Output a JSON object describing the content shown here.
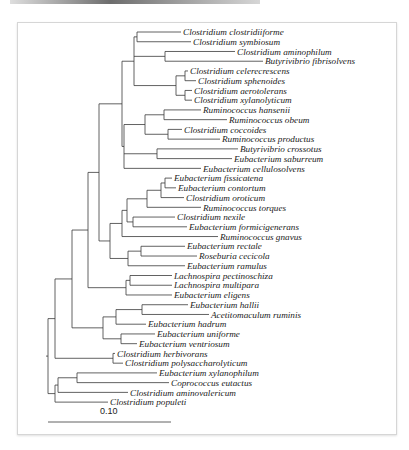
{
  "figure": {
    "type": "phylogenetic-tree",
    "scale_bar": {
      "label": "0.10",
      "x1": 48,
      "x2": 171,
      "y": 422,
      "label_x": 100,
      "label_y": 414
    },
    "leaf_layout": {
      "y_start": 32,
      "y_step": 9.74
    },
    "leaves": [
      {
        "name": "Clostridium clostridiiforme",
        "x": 183
      },
      {
        "name": "Clostridium symbiosum",
        "x": 193
      },
      {
        "name": "Clostridium aminophilum",
        "x": 237
      },
      {
        "name": "Butyrivibrio fibrisolvens",
        "x": 265
      },
      {
        "name": "Clostridium celerecrescens",
        "x": 190
      },
      {
        "name": "Clostridium sphenoides",
        "x": 198
      },
      {
        "name": "Clostridium aerotolerans",
        "x": 194
      },
      {
        "name": "Clostridium xylanolyticum",
        "x": 194
      },
      {
        "name": "Ruminococcus hansenii",
        "x": 203
      },
      {
        "name": "Ruminococcus obeum",
        "x": 229
      },
      {
        "name": "Clostridium coccoides",
        "x": 184
      },
      {
        "name": "Ruminococcus productus",
        "x": 222
      },
      {
        "name": "Butyrivibrio crossotus",
        "x": 240
      },
      {
        "name": "Eubacterium saburreum",
        "x": 234
      },
      {
        "name": "Eubacterium cellulosolvens",
        "x": 203
      },
      {
        "name": "Eubacterium fissicatena",
        "x": 174
      },
      {
        "name": "Eubacterium contortum",
        "x": 178
      },
      {
        "name": "Clostridium oroticum",
        "x": 186
      },
      {
        "name": "Ruminococcus torques",
        "x": 203
      },
      {
        "name": "Clostridium nexile",
        "x": 177
      },
      {
        "name": "Eubacterium formicigenerans",
        "x": 189
      },
      {
        "name": "Ruminococcus gnavus",
        "x": 220
      },
      {
        "name": "Eubacterium rectale",
        "x": 187
      },
      {
        "name": "Roseburia cecicola",
        "x": 199
      },
      {
        "name": "Eubacterium ramulus",
        "x": 187
      },
      {
        "name": "Lachnospira pectinoschiza",
        "x": 174
      },
      {
        "name": "Lachnospira multipara",
        "x": 174
      },
      {
        "name": "Eubacterium eligens",
        "x": 174
      },
      {
        "name": "Eubacterium hallii",
        "x": 190
      },
      {
        "name": "Acetitomaculum ruminis",
        "x": 211
      },
      {
        "name": "Eubacterium hadrum",
        "x": 148
      },
      {
        "name": "Eubacterium uniforme",
        "x": 157
      },
      {
        "name": "Eubacterium ventriosum",
        "x": 139
      },
      {
        "name": "Clostridium herbivorans",
        "x": 117
      },
      {
        "name": "Clostridium polysaccharolyticum",
        "x": 125
      },
      {
        "name": "Eubacterium xylanophilum",
        "x": 159
      },
      {
        "name": "Coprococcus eutactus",
        "x": 171
      },
      {
        "name": "Clostridium aminovalericum",
        "x": 130
      },
      {
        "name": "Clostridium populeti",
        "x": 110
      }
    ],
    "tree": {
      "x": 48,
      "children": [
        {
          "x": 55,
          "children": [
            {
              "x": 72,
              "children": [
                {
                  "x": 88,
                  "children": [
                    {
                      "x": 99,
                      "children": [
                        {
                          "x": 122,
                          "children": [
                            {
                              "x": 134,
                              "children": [
                                {
                                  "x": 137,
                                  "children": [
                                    {
                                      "leaf": 0
                                    },
                                    {
                                      "leaf": 1
                                    }
                                  ]
                                },
                                {
                                  "x": 165,
                                  "children": [
                                    {
                                      "leaf": 2
                                    },
                                    {
                                      "leaf": 3
                                    }
                                  ]
                                },
                                {
                                  "x": 176,
                                  "children": [
                                    {
                                      "x": 185,
                                      "children": [
                                        {
                                          "leaf": 4
                                        },
                                        {
                                          "leaf": 5
                                        }
                                      ]
                                    },
                                    {
                                      "x": 185,
                                      "children": [
                                        {
                                          "leaf": 6
                                        },
                                        {
                                          "leaf": 7
                                        }
                                      ]
                                    }
                                  ]
                                }
                              ]
                            },
                            {
                              "x": 124,
                              "children": [
                                {
                                  "x": 145,
                                  "children": [
                                    {
                                      "x": 164,
                                      "children": [
                                        {
                                          "leaf": 8
                                        },
                                        {
                                          "leaf": 9
                                        }
                                      ]
                                    },
                                    {
                                      "x": 168,
                                      "children": [
                                        {
                                          "leaf": 10
                                        },
                                        {
                                          "leaf": 11
                                        }
                                      ]
                                    }
                                  ]
                                },
                                {
                                  "x": 157,
                                  "children": [
                                    {
                                      "leaf": 12
                                    },
                                    {
                                      "leaf": 13
                                    }
                                  ]
                                },
                                {
                                  "leaf": 14
                                }
                              ]
                            }
                          ]
                        },
                        {
                          "x": 110,
                          "children": [
                            {
                              "x": 122,
                              "children": [
                                {
                                  "x": 127,
                                  "children": [
                                    {
                                      "x": 147,
                                      "children": [
                                        {
                                          "x": 161,
                                          "children": [
                                            {
                                              "x": 165,
                                              "children": [
                                                {
                                                  "leaf": 15
                                                },
                                                {
                                                  "leaf": 16
                                                }
                                              ]
                                            },
                                            {
                                              "leaf": 17
                                            }
                                          ]
                                        },
                                        {
                                          "leaf": 18
                                        }
                                      ]
                                    },
                                    {
                                      "x": 129,
                                      "children": [
                                        {
                                          "x": 133,
                                          "children": [
                                            {
                                              "leaf": 19
                                            },
                                            {
                                              "leaf": 20
                                            }
                                          ]
                                        }
                                      ]
                                    }
                                  ]
                                },
                                {
                                  "leaf": 21
                                }
                              ]
                            },
                            {
                              "x": 128,
                              "children": [
                                {
                                  "x": 141,
                                  "children": [
                                    {
                                      "leaf": 22
                                    },
                                    {
                                      "leaf": 23
                                    }
                                  ]
                                },
                                {
                                  "leaf": 24
                                }
                              ]
                            }
                          ]
                        }
                      ]
                    },
                    {
                      "x": 126,
                      "children": [
                        {
                          "x": 130,
                          "children": [
                            {
                              "leaf": 25
                            },
                            {
                              "leaf": 26
                            }
                          ]
                        },
                        {
                          "leaf": 27
                        }
                      ]
                    }
                  ]
                },
                {
                  "x": 103,
                  "children": [
                    {
                      "x": 116,
                      "children": [
                        {
                          "x": 142,
                          "children": [
                            {
                              "leaf": 28
                            },
                            {
                              "leaf": 29
                            }
                          ]
                        },
                        {
                          "leaf": 30
                        }
                      ]
                    },
                    {
                      "x": 121,
                      "children": [
                        {
                          "leaf": 31
                        },
                        {
                          "leaf": 32
                        }
                      ]
                    }
                  ]
                }
              ]
            },
            {
              "x": 113,
              "children": [
                {
                  "leaf": 33
                },
                {
                  "leaf": 34
                }
              ]
            }
          ]
        },
        {
          "x": 55,
          "children": [
            {
              "x": 58,
              "children": [
                {
                  "x": 77,
                  "children": [
                    {
                      "leaf": 35
                    },
                    {
                      "leaf": 36
                    }
                  ]
                },
                {
                  "leaf": 37
                }
              ]
            },
            {
              "leaf": 38
            }
          ]
        }
      ]
    }
  }
}
